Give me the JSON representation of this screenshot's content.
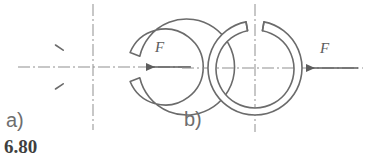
{
  "figure": {
    "caption": "6.80",
    "background_color": "#ffffff",
    "line_color": "#6b6b6b",
    "centerline_color": "#8a8a8a",
    "caption_color": "#3f3f3f",
    "diagram_type": "engineering-drawing",
    "parts": [
      {
        "id": "a",
        "label": "a)",
        "gap_position": "left",
        "gap_description": "split gap on the horizontal centerline, left side, bevelled ends",
        "center": {
          "x": 93,
          "y": 67
        },
        "outer_radius": 48,
        "inner_radius": 38,
        "gap_half_angle_deg": 13,
        "force": {
          "symbol": "F",
          "direction": "left",
          "applied_at": "right outer edge on horizontal centerline",
          "tip": {
            "x": 145,
            "y": 67
          },
          "tail": {
            "x": 191,
            "y": 67
          }
        }
      },
      {
        "id": "b",
        "label": "b)",
        "gap_position": "top",
        "gap_description": "split gap on the vertical centerline, top side, bevelled ends",
        "center": {
          "x": 255,
          "y": 68
        },
        "outer_radius": 47,
        "inner_radius": 39,
        "gap_half_angle_deg": 11,
        "force": {
          "symbol": "F",
          "direction": "left",
          "applied_at": "right outer edge on horizontal centerline",
          "tip": {
            "x": 305,
            "y": 68
          },
          "tail": {
            "x": 358,
            "y": 68
          }
        }
      }
    ]
  }
}
